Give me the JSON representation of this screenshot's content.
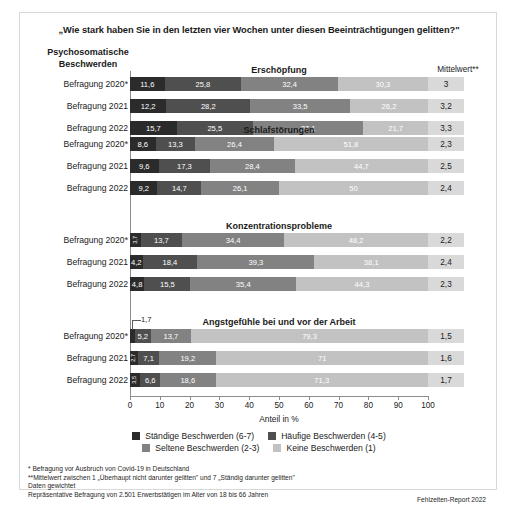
{
  "title": "„Wie stark haben Sie in den letzten vier Wochen unter diesen Beeinträchtigungen gelitten?\"",
  "headers": {
    "left_line1": "Psychosomatische",
    "left_line2": "Beschwerden",
    "mittelwert": "Mittelwert**"
  },
  "axis": {
    "caption": "Anteil in %",
    "ticks": [
      "0",
      "10",
      "20",
      "30",
      "40",
      "50",
      "60",
      "70",
      "80",
      "90",
      "100"
    ],
    "min": 0,
    "max": 100
  },
  "callout": {
    "label": "1,7"
  },
  "legend": {
    "items": [
      {
        "label": "Ständige Beschwerden (6-7)",
        "color": "#2b2b2b"
      },
      {
        "label": "Häufige Beschwerden (4-5)",
        "color": "#4f4f4f"
      },
      {
        "label": "Seltene Beschwerden (2-3)",
        "color": "#828282"
      },
      {
        "label": "Keine Beschwerden (1)",
        "color": "#c2c2c2"
      }
    ]
  },
  "footnotes": {
    "line1": "*  Befragung vor Ausbruch von Covid-19 in Deutschland",
    "line2": "**Mittelwert zwischen 1 „Überhaupt nicht darunter gelitten\" und 7 „Ständig darunter gelitten\"",
    "line3": "Daten gewichtet",
    "line4": "Repräsentative Befragung von 2.501 Erwerbstätigen im Alter von 18 bis 66 Jahren",
    "source": "Fehlzeiten-Report 2022"
  },
  "chart_data": {
    "type": "bar",
    "orientation": "horizontal",
    "stacked": true,
    "title": "„Wie stark haben Sie in den letzten vier Wochen unter diesen Beeinträchtigungen gelitten?\"",
    "xlabel": "Anteil in %",
    "ylabel": "",
    "xlim": [
      0,
      100
    ],
    "grid": false,
    "legend_position": "bottom",
    "series": [
      {
        "name": "Ständige Beschwerden (6-7)",
        "color": "#2b2b2b"
      },
      {
        "name": "Häufige Beschwerden (4-5)",
        "color": "#4f4f4f"
      },
      {
        "name": "Seltene Beschwerden (2-3)",
        "color": "#828282"
      },
      {
        "name": "Keine Beschwerden (1)",
        "color": "#c2c2c2"
      }
    ],
    "groups": [
      {
        "title": "Erschöpfung",
        "rows": [
          {
            "label": "Befragung 2020*",
            "values": [
              11.6,
              25.8,
              32.4,
              30.3
            ],
            "labels": [
              "11,6",
              "25,8",
              "32,4",
              "30,3"
            ],
            "mean": "3"
          },
          {
            "label": "Befragung 2021",
            "values": [
              12.2,
              28.2,
              33.5,
              26.2
            ],
            "labels": [
              "12,2",
              "28,2",
              "33,5",
              "26,2"
            ],
            "mean": "3,2"
          },
          {
            "label": "Befragung 2022",
            "values": [
              15.7,
              25.5,
              37.1,
              21.7
            ],
            "labels": [
              "15,7",
              "25,5",
              "37,1",
              "21,7"
            ],
            "mean": "3,3"
          }
        ]
      },
      {
        "title": "Schlafstörungen",
        "rows": [
          {
            "label": "Befragung 2020*",
            "values": [
              8.6,
              13.3,
              26.4,
              51.8
            ],
            "labels": [
              "8,6",
              "13,3",
              "26,4",
              "51,8"
            ],
            "mean": "2,3"
          },
          {
            "label": "Befragung 2021",
            "values": [
              9.6,
              17.3,
              28.4,
              44.7
            ],
            "labels": [
              "9,6",
              "17,3",
              "28,4",
              "44,7"
            ],
            "mean": "2,5"
          },
          {
            "label": "Befragung 2022",
            "values": [
              9.2,
              14.7,
              26.1,
              50.0
            ],
            "labels": [
              "9,2",
              "14,7",
              "26,1",
              "50"
            ],
            "mean": "2,4"
          }
        ]
      },
      {
        "title": "Konzentrationsprobleme",
        "rows": [
          {
            "label": "Befragung 2020*",
            "values": [
              3.7,
              13.7,
              34.4,
              48.2
            ],
            "labels": [
              "3,7",
              "13,7",
              "34,4",
              "48,2"
            ],
            "rotated": [
              0
            ],
            "mean": "2,2"
          },
          {
            "label": "Befragung 2021",
            "values": [
              4.2,
              18.4,
              39.3,
              38.1
            ],
            "labels": [
              "4,2",
              "18,4",
              "39,3",
              "38,1"
            ],
            "rotated": [],
            "mean": "2,4"
          },
          {
            "label": "Befragung 2022",
            "values": [
              4.8,
              15.5,
              35.4,
              44.3
            ],
            "labels": [
              "4,8",
              "15,5",
              "35,4",
              "44,3"
            ],
            "rotated": [],
            "mean": "2,3"
          }
        ]
      },
      {
        "title": "Angstgefühle bei und vor der Arbeit",
        "rows": [
          {
            "label": "Befragung 2020*",
            "values": [
              1.7,
              5.2,
              13.7,
              79.3
            ],
            "labels": [
              "1,7",
              "5,2",
              "13,7",
              "79,3"
            ],
            "rotated": [
              0
            ],
            "callout": 0,
            "mean": "1,5"
          },
          {
            "label": "Befragung 2021",
            "values": [
              2.7,
              7.1,
              19.2,
              71.0
            ],
            "labels": [
              "2,7",
              "7,1",
              "19,2",
              "71"
            ],
            "rotated": [
              0
            ],
            "mean": "1,6"
          },
          {
            "label": "Befragung 2022",
            "values": [
              3.5,
              6.6,
              18.6,
              71.3
            ],
            "labels": [
              "3,5",
              "6,6",
              "18,6",
              "71,3"
            ],
            "rotated": [
              0
            ],
            "mean": "1,7"
          }
        ]
      }
    ]
  }
}
